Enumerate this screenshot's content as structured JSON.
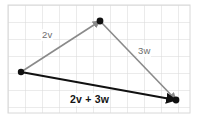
{
  "figure": {
    "type": "vector-diagram",
    "title": "",
    "background_color": "#ffffff",
    "grid": {
      "visible": true,
      "color": "#d8d8d8",
      "cell_size_px": 17,
      "x_start_px": 8,
      "x_end_px": 190,
      "y_start_px": 5,
      "y_end_px": 113,
      "columns": 11,
      "rows": 7
    },
    "colors": {
      "component_vector": "#8a8a8a",
      "resultant_vector": "#111111",
      "vertex_dot": "#111111",
      "grid_line": "#d8d8d8"
    },
    "points": [
      {
        "name": "tail",
        "x": 21,
        "y": 72
      },
      {
        "name": "apex",
        "x": 100,
        "y": 21
      },
      {
        "name": "head",
        "x": 176,
        "y": 100
      }
    ],
    "vectors": [
      {
        "id": "vector-2v",
        "label": "2v",
        "style": "component",
        "color": "#8a8a8a",
        "bold": false,
        "from": "tail",
        "to": "apex",
        "x1": 21,
        "y1": 72,
        "x2": 100,
        "y2": 21,
        "arrowhead": true,
        "label_x": 41,
        "label_y": 29
      },
      {
        "id": "vector-3w",
        "label": "3w",
        "style": "component",
        "color": "#8a8a8a",
        "bold": false,
        "from": "apex",
        "to": "head",
        "x1": 100,
        "y1": 21,
        "x2": 176,
        "y2": 100,
        "arrowhead": true,
        "label_x": 137,
        "label_y": 45
      },
      {
        "id": "vector-sum",
        "label": "2v + 3w",
        "style": "resultant",
        "color": "#111111",
        "bold": true,
        "from": "tail",
        "to": "head",
        "x1": 21,
        "y1": 72,
        "x2": 176,
        "y2": 100,
        "arrowhead": true,
        "label_x": 69,
        "label_y": 93
      }
    ]
  }
}
